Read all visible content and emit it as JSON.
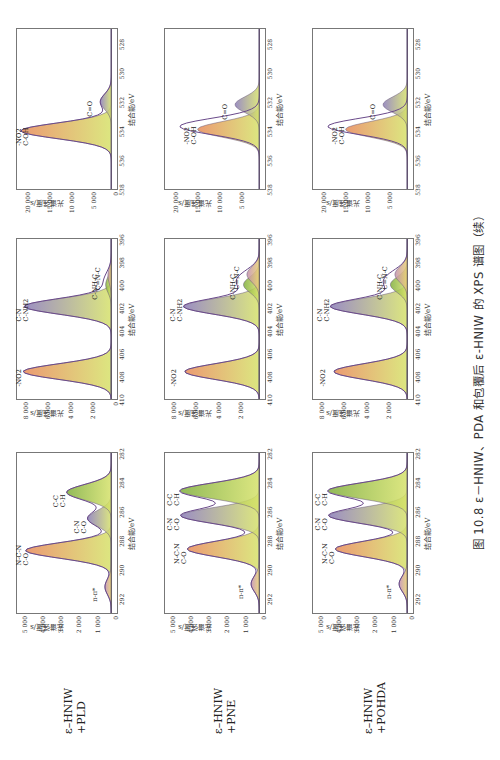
{
  "caption": "图 10.8  ε－HNIW、PDA 和包覆后 ε-HNIW 的 XPS 谱图（续）",
  "rows": [
    {
      "label_line1": "ε–HNIW",
      "label_line2": "+PLD"
    },
    {
      "label_line1": "ε–HNIW",
      "label_line2": "+PNE"
    },
    {
      "label_line1": "ε–HNIW",
      "label_line2": "+POHDA"
    }
  ],
  "axis_text": {
    "ylabel": "光谱强度/s",
    "xlabel": "结合能/eV"
  },
  "chart_data": [
    {
      "type": "area",
      "title": "ε-HNIW+PLD C1s",
      "xlabel": "结合能/eV",
      "ylabel": "光谱强度/s",
      "xlim": [
        293,
        282
      ],
      "ylim": [
        0,
        5200
      ],
      "xticks": [
        "292",
        "290",
        "288",
        "286",
        "284",
        "282"
      ],
      "yticks": [
        "0",
        "1 000",
        "2 000",
        "3 000",
        "4 000",
        "5 000"
      ],
      "series": [
        {
          "name": "N-C-N / C-O",
          "center": 288.7,
          "height": 4700
        },
        {
          "name": "C-N / C-O",
          "center": 286.5,
          "height": 1300
        },
        {
          "name": "C-C / C-H",
          "center": 284.7,
          "height": 2450
        },
        {
          "name": "π-π*",
          "center": 291.2,
          "height": 350
        }
      ],
      "annotations": [
        "N-C-N",
        "C-O",
        "C-N",
        "C-O",
        "C-C",
        "C-H",
        "π-π*"
      ]
    },
    {
      "type": "area",
      "title": "ε-HNIW+PLD N1s",
      "xlim": [
        410,
        396
      ],
      "ylim": [
        0,
        8400
      ],
      "xticks": [
        "410",
        "408",
        "406",
        "404",
        "402",
        "400",
        "398",
        "396"
      ],
      "yticks": [
        "0",
        "2 000",
        "4 000",
        "6 000",
        "8 000"
      ],
      "series": [
        {
          "name": "-NO2",
          "center": 407.6,
          "height": 7800
        },
        {
          "name": "C-N / C-NH2",
          "center": 401.9,
          "height": 7700
        },
        {
          "name": "C-NH-C",
          "center": 400.0,
          "height": 500
        },
        {
          "name": "C=N-C",
          "center": 399.2,
          "height": 300
        }
      ],
      "annotations": [
        "-NO2",
        "C-N",
        "C-NH2",
        "C-NH-C",
        "C=N-C"
      ]
    },
    {
      "type": "area",
      "title": "ε-HNIW+PLD O1s",
      "xlim": [
        538,
        527
      ],
      "ylim": [
        0,
        21500
      ],
      "xticks": [
        "538",
        "536",
        "534",
        "532",
        "530",
        "528"
      ],
      "yticks": [
        "0",
        "5 000",
        "10 000",
        "15 000",
        "20 000"
      ],
      "series": [
        {
          "name": "-NO2 / C-OH",
          "center": 534.0,
          "height": 20500
        },
        {
          "name": "C=O",
          "center": 532.0,
          "height": 2500
        }
      ],
      "annotations": [
        "-NO2",
        "C-OH",
        "C=O"
      ]
    },
    {
      "type": "area",
      "title": "ε-HNIW+PNE C1s",
      "xlim": [
        293,
        282
      ],
      "ylim": [
        0,
        5200
      ],
      "xticks": [
        "292",
        "290",
        "288",
        "286",
        "284",
        "282"
      ],
      "yticks": [
        "0",
        "1 000",
        "2 000",
        "3 000",
        "4 000",
        "5 000"
      ],
      "series": [
        {
          "name": "N-C-N / C-O",
          "center": 288.6,
          "height": 3950
        },
        {
          "name": "C-N / C-O",
          "center": 286.3,
          "height": 4300
        },
        {
          "name": "C-C / C-H",
          "center": 284.6,
          "height": 4350
        },
        {
          "name": "π-π*",
          "center": 291.0,
          "height": 450
        }
      ],
      "annotations": [
        "N-C-N",
        "C-O",
        "C-N",
        "C-O",
        "C-C",
        "C-H",
        "π-π*"
      ]
    },
    {
      "type": "area",
      "title": "ε-HNIW+PNE N1s",
      "xlim": [
        410,
        396
      ],
      "ylim": [
        0,
        8400
      ],
      "xticks": [
        "410",
        "408",
        "406",
        "404",
        "402",
        "400",
        "398",
        "396"
      ],
      "yticks": [
        "2 000",
        "4 000",
        "6 000",
        "8 000"
      ],
      "series": [
        {
          "name": "-NO2",
          "center": 407.6,
          "height": 6600
        },
        {
          "name": "C-N / C-NH2",
          "center": 401.9,
          "height": 6700
        },
        {
          "name": "C-NH-C",
          "center": 400.0,
          "height": 1400
        },
        {
          "name": "C=N-C",
          "center": 399.1,
          "height": 1100
        }
      ],
      "annotations": [
        "-NO2",
        "C-N",
        "C-NH2",
        "C-NH-C",
        "C=N-C"
      ]
    },
    {
      "type": "area",
      "title": "ε-HNIW+PNE O1s",
      "xlim": [
        538,
        527
      ],
      "ylim": [
        0,
        21500
      ],
      "xticks": [
        "538",
        "536",
        "534",
        "532",
        "530",
        "528"
      ],
      "yticks": [
        "5 000",
        "10 000",
        "15 000",
        "20 000"
      ],
      "series": [
        {
          "name": "-NO2 / C-OH",
          "center": 533.9,
          "height": 14000
        },
        {
          "name": "C=O",
          "center": 532.2,
          "height": 5500
        },
        {
          "name": "envelope",
          "center": 533.7,
          "height": 18000
        }
      ],
      "annotations": [
        "-NO2",
        "C-OH",
        "C=O"
      ]
    },
    {
      "type": "area",
      "title": "ε-HNIW+POHDA C1s",
      "xlim": [
        293,
        282
      ],
      "ylim": [
        0,
        5200
      ],
      "xticks": [
        "292",
        "290",
        "288",
        "286",
        "284",
        "282"
      ],
      "yticks": [
        "0",
        "1 000",
        "2 000",
        "3 000",
        "4 000",
        "5 000"
      ],
      "series": [
        {
          "name": "N-C-N / C-O",
          "center": 288.6,
          "height": 3950
        },
        {
          "name": "C-N / C-O",
          "center": 286.3,
          "height": 4300
        },
        {
          "name": "C-C / C-H",
          "center": 284.6,
          "height": 4350
        },
        {
          "name": "π-π*",
          "center": 291.0,
          "height": 450
        }
      ],
      "annotations": [
        "N-C-N",
        "C-O",
        "C-N",
        "C-O",
        "C-C",
        "C-H",
        "π-π*"
      ]
    },
    {
      "type": "area",
      "title": "ε-HNIW+POHDA N1s",
      "xlim": [
        410,
        396
      ],
      "ylim": [
        0,
        8400
      ],
      "xticks": [
        "410",
        "408",
        "406",
        "404",
        "402",
        "400",
        "398",
        "396"
      ],
      "yticks": [
        "2 000",
        "4 000",
        "6 000",
        "8 000"
      ],
      "series": [
        {
          "name": "-NO2",
          "center": 407.6,
          "height": 6500
        },
        {
          "name": "C-N / C-NH2",
          "center": 401.9,
          "height": 6800
        },
        {
          "name": "C-NH-C",
          "center": 400.0,
          "height": 1500
        },
        {
          "name": "C=N-C",
          "center": 399.1,
          "height": 1100
        }
      ],
      "annotations": [
        "-NO2",
        "C-N",
        "C-NH2",
        "C-NH-C",
        "C=N-C"
      ]
    },
    {
      "type": "area",
      "title": "ε-HNIW+POHDA O1s",
      "xlim": [
        538,
        527
      ],
      "ylim": [
        0,
        21500
      ],
      "xticks": [
        "538",
        "536",
        "534",
        "532",
        "530",
        "528"
      ],
      "yticks": [
        "5 000",
        "10 000",
        "15 000",
        "20 000"
      ],
      "series": [
        {
          "name": "-NO2 / C-OH",
          "center": 533.9,
          "height": 14000
        },
        {
          "name": "C=O",
          "center": 532.2,
          "height": 5500
        },
        {
          "name": "envelope",
          "center": 533.7,
          "height": 18000
        }
      ],
      "annotations": [
        "-NO2",
        "C-OH",
        "C=O"
      ]
    }
  ]
}
